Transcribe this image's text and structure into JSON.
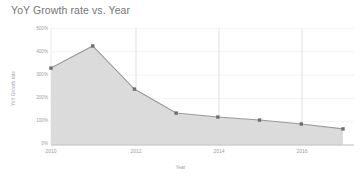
{
  "chart_data": {
    "type": "area",
    "title": "YoY Growth rate vs. Year",
    "xlabel": "Year",
    "ylabel": "YoY Growth rate",
    "x": [
      2010,
      2011,
      2012,
      2013,
      2014,
      2015,
      2016,
      2017
    ],
    "values": [
      330,
      425,
      240,
      137,
      120,
      107,
      90,
      69
    ],
    "series": [
      {
        "name": "YoY Growth rate",
        "values": [
          330,
          425,
          240,
          137,
          120,
          107,
          90,
          69
        ]
      }
    ],
    "xlim": [
      2010,
      2017
    ],
    "ylim": [
      0,
      500
    ],
    "y_tick_labels": [
      "0%",
      "100%",
      "200%",
      "300%",
      "400%",
      "500%"
    ],
    "y_tick_values": [
      0,
      100,
      200,
      300,
      400,
      500
    ],
    "x_tick_labels": [
      "2010",
      "2012",
      "2014",
      "2016"
    ],
    "x_tick_values": [
      2010,
      2012,
      2014,
      2016
    ],
    "grid": true,
    "legend": "none",
    "colors": {
      "line": "#9a9a9a",
      "fill": "#d9d9d9",
      "marker": "#6e6e6e",
      "grid": "#ebebeb",
      "axis": "#bdbdbd",
      "text": "#9e9e9e",
      "title_text": "#757575",
      "background": "#ffffff"
    }
  },
  "labels": {
    "title": "YoY Growth rate vs. Year",
    "x_axis_title": "Year",
    "y_axis_title": "YoY Growth rate",
    "y0": "0%",
    "y1": "100%",
    "y2": "200%",
    "y3": "300%",
    "y4": "400%",
    "y5": "500%",
    "x0": "2010",
    "x1": "2012",
    "x2": "2014",
    "x3": "2016"
  }
}
